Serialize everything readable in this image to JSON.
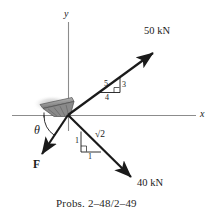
{
  "figure": {
    "caption": "Probs. 2–48/2–49",
    "axes": {
      "y_label": "y",
      "x_label": "x"
    },
    "vectors": [
      {
        "id": "force-50kn",
        "label": "50 kN",
        "direction": "up-right",
        "slope_triangle": {
          "hypotenuse": "5",
          "vertical": "3",
          "horizontal": "4"
        }
      },
      {
        "id": "force-40kn",
        "label": "40 kN",
        "direction": "down-right",
        "slope_triangle": {
          "hypotenuse": "√2",
          "vertical": "1",
          "horizontal": "1"
        }
      },
      {
        "id": "force-f",
        "label": "F",
        "direction": "down-left",
        "angle_label": "θ"
      }
    ],
    "colors": {
      "ink": "#1a1a1a",
      "axis": "#8c8c8c",
      "support_fill": "#7d7d7d",
      "support_shadow": "#b9b9b9"
    }
  }
}
